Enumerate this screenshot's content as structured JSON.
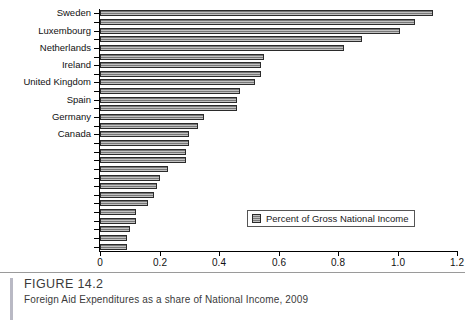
{
  "figure": {
    "number": "FIGURE 14.2",
    "title": "Foreign Aid Expenditures as a share of National Income, 2009"
  },
  "legend": {
    "position": "inside-bottom-right",
    "entries": [
      {
        "label": "Percent of Gross National Income",
        "swatch_color": "#787878"
      }
    ]
  },
  "axis": {
    "x_ticks": [
      "0",
      "0.2",
      "0.4",
      "0.6",
      "0.8",
      "1.0",
      "1.2"
    ],
    "x_tick_values": [
      0,
      0.2,
      0.4,
      0.6,
      0.8,
      1.0,
      1.2
    ],
    "x_min": 0,
    "x_max": 1.2
  },
  "chart_data": {
    "type": "bar",
    "orientation": "horizontal",
    "title": "Foreign Aid Expenditures as a share of National Income, 2009",
    "xlabel": "",
    "ylabel": "",
    "xlim": [
      0,
      1.2
    ],
    "grid": false,
    "legend_position": "inside-bottom-right",
    "tick_label_interval": 2,
    "categories": [
      "Sweden",
      "Norway",
      "Luxembourg",
      "Denmark",
      "Netherlands",
      "Belgium",
      "Ireland",
      "Finland",
      "United Kingdom",
      "Switzerland",
      "Spain",
      "France",
      "Germany",
      "Austria",
      "Canada",
      "Australia",
      "New Zealand",
      "Portugal",
      "United States",
      "Greece",
      "Japan",
      "Italy",
      "Korea",
      "Czech Republic",
      "Turkey",
      "Hungary",
      "Slovak Republic",
      "Poland"
    ],
    "visible_tick_labels": [
      "Sweden",
      "Luxembourg",
      "Netherlands",
      "Ireland",
      "United Kingdom",
      "Spain",
      "Germany",
      "Canada",
      "Australia",
      "Portugal",
      "Greece",
      "Italy",
      "Czech Republic",
      "Hungary",
      "Poland"
    ],
    "values": [
      1.12,
      1.06,
      1.01,
      0.88,
      0.82,
      0.55,
      0.54,
      0.54,
      0.52,
      0.47,
      0.46,
      0.46,
      0.35,
      0.33,
      0.3,
      0.3,
      0.29,
      0.29,
      0.23,
      0.2,
      0.19,
      0.18,
      0.16,
      0.12,
      0.12,
      0.1,
      0.09,
      0.09
    ],
    "series": [
      {
        "name": "Percent of Gross National Income",
        "color": "#787878",
        "values": [
          1.12,
          1.06,
          1.01,
          0.88,
          0.82,
          0.55,
          0.54,
          0.54,
          0.52,
          0.47,
          0.46,
          0.46,
          0.35,
          0.33,
          0.3,
          0.3,
          0.29,
          0.29,
          0.23,
          0.2,
          0.19,
          0.18,
          0.16,
          0.12,
          0.12,
          0.1,
          0.09,
          0.09
        ]
      }
    ]
  }
}
